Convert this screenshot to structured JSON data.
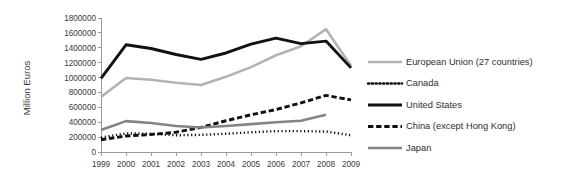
{
  "chart_data": {
    "type": "line",
    "title": "",
    "xlabel": "",
    "ylabel": "Million Euros",
    "x": [
      1999,
      2000,
      2001,
      2002,
      2003,
      2004,
      2005,
      2006,
      2007,
      2008,
      2009
    ],
    "xtick_labels": [
      "1999",
      "2000",
      "2001",
      "2002",
      "2003",
      "2004",
      "2005",
      "2006",
      "2007",
      "2008",
      "2009"
    ],
    "ylim": [
      0,
      1800000
    ],
    "ytick_values": [
      0,
      200000,
      400000,
      600000,
      800000,
      1000000,
      1200000,
      1400000,
      1600000,
      1800000
    ],
    "ytick_labels": [
      "0",
      "200000",
      "400000",
      "600000",
      "800000",
      "1000000",
      "1200000",
      "1400000",
      "1600000",
      "1800000"
    ],
    "grid": false,
    "legend_position": "right",
    "series": [
      {
        "name": "European Union (27 countries)",
        "color": "#b3b3b3",
        "style": "solid",
        "width": 2.6,
        "values": [
          740000,
          995000,
          970000,
          930000,
          900000,
          1010000,
          1140000,
          1300000,
          1420000,
          1650000,
          1160000
        ]
      },
      {
        "name": "Canada",
        "color": "#111111",
        "style": "dotted",
        "width": 2.4,
        "values": [
          195000,
          250000,
          245000,
          225000,
          230000,
          245000,
          265000,
          280000,
          280000,
          275000,
          225000
        ]
      },
      {
        "name": "United States",
        "color": "#111111",
        "style": "solid",
        "width": 2.9,
        "values": [
          990000,
          1440000,
          1390000,
          1310000,
          1245000,
          1330000,
          1450000,
          1530000,
          1455000,
          1490000,
          1130000
        ]
      },
      {
        "name": "China (except Hong Kong)",
        "color": "#111111",
        "style": "dashed",
        "width": 2.9,
        "values": [
          165000,
          215000,
          235000,
          265000,
          330000,
          420000,
          500000,
          570000,
          660000,
          760000,
          700000
        ]
      },
      {
        "name": "Japan",
        "color": "#848484",
        "style": "solid",
        "width": 2.6,
        "values": [
          295000,
          415000,
          390000,
          350000,
          330000,
          350000,
          375000,
          400000,
          420000,
          500000,
          null
        ]
      }
    ]
  },
  "legend": {
    "items": [
      {
        "label": "European Union (27 countries)"
      },
      {
        "label": "Canada"
      },
      {
        "label": "United States"
      },
      {
        "label": "China (except Hong Kong)"
      },
      {
        "label": "Japan"
      }
    ]
  }
}
